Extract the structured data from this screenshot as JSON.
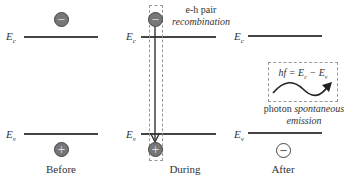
{
  "panels": [
    {
      "caption": "Before",
      "conduction_label": "E",
      "conduction_sub": "c",
      "valence_label": "E",
      "valence_sub": "v",
      "electron": "−",
      "hole": "+"
    },
    {
      "caption": "During",
      "conduction_label": "E",
      "conduction_sub": "c",
      "valence_label": "E",
      "valence_sub": "v",
      "electron": "−",
      "hole": "+",
      "annotation_line1": "e-h pair",
      "annotation_line2": "recombination"
    },
    {
      "caption": "After",
      "conduction_label": "E",
      "conduction_sub": "c",
      "valence_label": "E",
      "valence_sub": "v",
      "state": "−",
      "equation": "hf = Ec − Ev",
      "equation_parts": {
        "lhs": "hf = ",
        "e1": "E",
        "s1": "c",
        "minus": " − ",
        "e2": "E",
        "s2": "v"
      },
      "annotation_line1_normal": "photon ",
      "annotation_line1_italic": "spontaneous",
      "annotation_line2": "emission"
    }
  ],
  "colors": {
    "level_line": "#444444",
    "particle_fill": "#777777",
    "dashed": "#999999",
    "text": "#333333"
  }
}
